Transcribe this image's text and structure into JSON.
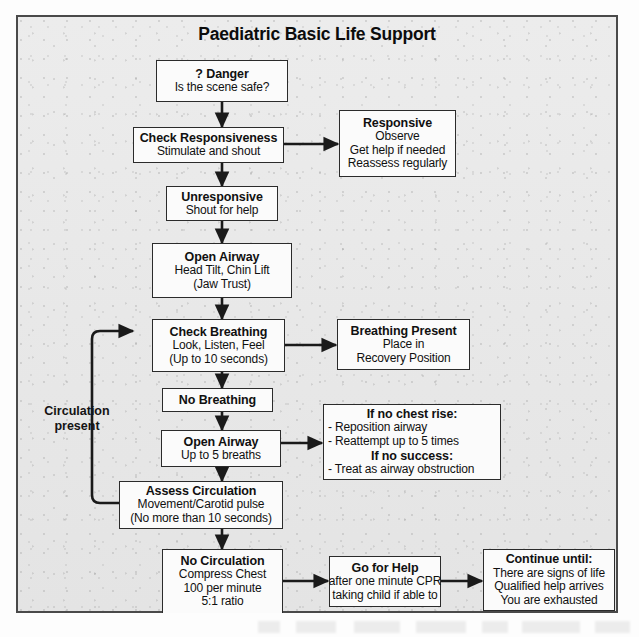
{
  "title": "Paediatric Basic Life Support",
  "loop_label": "Circulation\npresent",
  "loop_label_line1": "Circulation",
  "loop_label_line2": "present",
  "nodes": {
    "danger": {
      "title": "? Danger",
      "lines": [
        "Is the scene safe?"
      ]
    },
    "check_resp": {
      "title": "Check Responsiveness",
      "lines": [
        "Stimulate and shout"
      ]
    },
    "responsive": {
      "title": "Responsive",
      "lines": [
        "Observe",
        "Get help if needed",
        "Reassess regularly"
      ]
    },
    "unresponsive": {
      "title": "Unresponsive",
      "lines": [
        "Shout for help"
      ]
    },
    "open_airway_1": {
      "title": "Open Airway",
      "lines": [
        "Head Tilt, Chin Lift",
        "(Jaw Trust)"
      ]
    },
    "check_breath": {
      "title": "Check Breathing",
      "lines": [
        "Look, Listen, Feel",
        "(Up to 10 seconds)"
      ]
    },
    "breath_present": {
      "title": "Breathing Present",
      "lines": [
        "Place in",
        "Recovery Position"
      ]
    },
    "no_breathing": {
      "title": "No Breathing",
      "lines": []
    },
    "open_airway_2": {
      "title": "Open Airway",
      "lines": [
        "Up to 5 breaths"
      ]
    },
    "no_chest_rise": {
      "title": "If no chest rise:",
      "lines": [
        "- Reposition airway",
        "- Reattempt up to 5 times"
      ],
      "title2": "If no success:",
      "lines2": [
        "- Treat as airway obstruction"
      ]
    },
    "assess_circ": {
      "title": "Assess Circulation",
      "lines": [
        "Movement/Carotid pulse",
        "(No more than 10 seconds)"
      ]
    },
    "no_circulation": {
      "title": "No Circulation",
      "lines": [
        "Compress Chest",
        "100 per minute",
        "5:1 ratio"
      ]
    },
    "go_for_help": {
      "title": "Go for Help",
      "lines": [
        "after one minute CPR",
        "taking child if able to"
      ]
    },
    "continue_until": {
      "title": "Continue until:",
      "lines": [
        "There are signs of life",
        "Qualified help arrives",
        "You are exhausted"
      ]
    }
  },
  "colors": {
    "ink": "#101010",
    "box_border": "#2b2b2b",
    "box_fill": "#fbfbfb",
    "frame_border": "#4a4a4a",
    "page_bg": "#e7e7e7",
    "arrow": "#1a1a1a"
  }
}
